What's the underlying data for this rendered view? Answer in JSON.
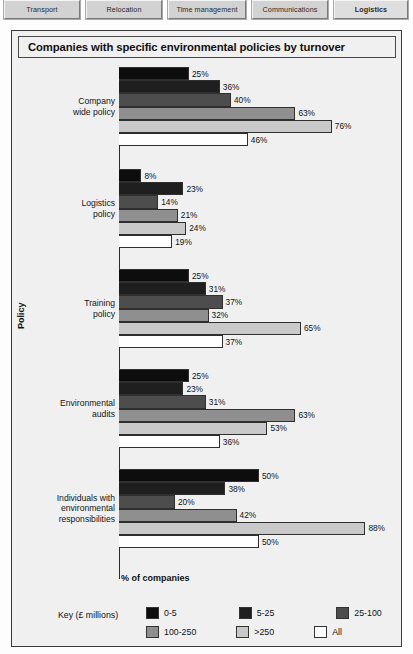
{
  "tabs": [
    {
      "label": "Transport",
      "active": false
    },
    {
      "label": "Relocation",
      "active": false
    },
    {
      "label": "Time management",
      "active": false
    },
    {
      "label": "Communications",
      "active": false
    },
    {
      "label": "Logistics",
      "active": true
    }
  ],
  "chart_data": {
    "type": "bar",
    "orientation": "horizontal",
    "title": "Companies with specific environmental policies by turnover",
    "xlabel": "% of companies",
    "ylabel": "Policy",
    "xlim": [
      0,
      100
    ],
    "grid": false,
    "legend_title": "Key (£ millions)",
    "legend_position": "bottom",
    "value_suffix": "%",
    "categories": [
      "Company\nwide policy",
      "Logistics\npolicy",
      "Training\npolicy",
      "Environmental\naudits",
      "Individuals with\nenvironmental\nresponsibilities"
    ],
    "series": [
      {
        "name": "0-5",
        "color": "#0d0d0d",
        "values": [
          25,
          8,
          25,
          25,
          50
        ]
      },
      {
        "name": "5-25",
        "color": "#1f1f1f",
        "values": [
          36,
          23,
          31,
          23,
          38
        ]
      },
      {
        "name": "25-100",
        "color": "#4d4d4d",
        "values": [
          40,
          14,
          37,
          31,
          20
        ]
      },
      {
        "name": "100-250",
        "color": "#8f8f8f",
        "values": [
          63,
          21,
          32,
          63,
          42
        ]
      },
      {
        "name": ">250",
        "color": "#c9c9c9",
        "values": [
          76,
          24,
          65,
          53,
          88
        ]
      },
      {
        "name": "All",
        "color": "#ffffff",
        "values": [
          46,
          19,
          37,
          36,
          50
        ]
      }
    ],
    "labels": [
      [
        "25%",
        "36%",
        "40%",
        "63%",
        "76%",
        "46%"
      ],
      [
        "8%",
        "23%",
        "14%",
        "21%",
        "24%",
        "19%"
      ],
      [
        "25%",
        "31%",
        "37%",
        "32%",
        "65%",
        "37%"
      ],
      [
        "25%",
        "23%",
        "31%",
        "63%",
        "53%",
        "36%"
      ],
      [
        "50%",
        "38%",
        "20%",
        "42%",
        "88%",
        "50%"
      ]
    ]
  }
}
